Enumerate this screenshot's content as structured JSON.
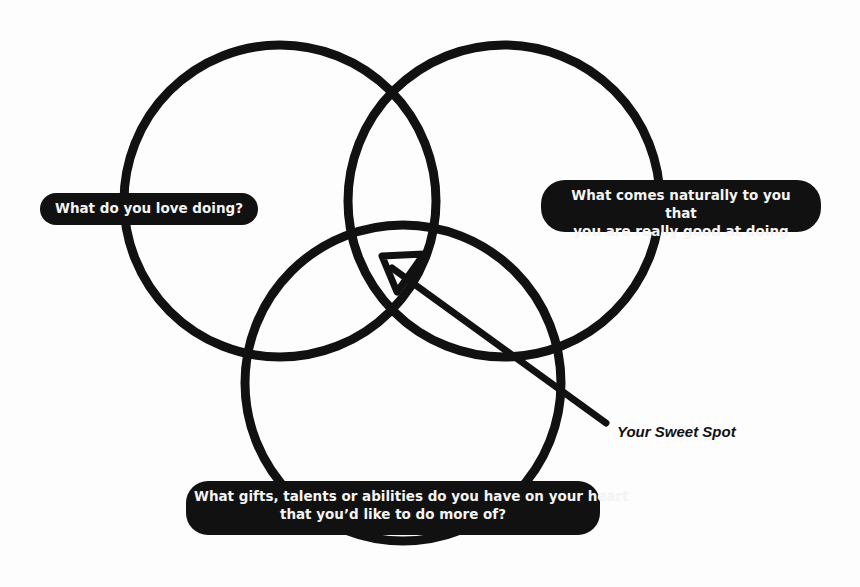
{
  "diagram": {
    "type": "venn",
    "circles": [
      {
        "id": "love",
        "label": "What do you love doing?"
      },
      {
        "id": "natural",
        "label_line1": "What comes naturally to you that",
        "label_line2": "you are really good at doing"
      },
      {
        "id": "gifts",
        "label_line1": "What gifts, talents or abilities do you have on your heart",
        "label_line2": "that you’d like to do more of?"
      }
    ],
    "annotation": {
      "label": "Your Sweet Spot",
      "points_to": "center intersection"
    },
    "colors": {
      "stroke": "#111111",
      "pill_bg": "#111111",
      "pill_text": "#f4f4f4",
      "background": "#fdfdfd"
    }
  }
}
